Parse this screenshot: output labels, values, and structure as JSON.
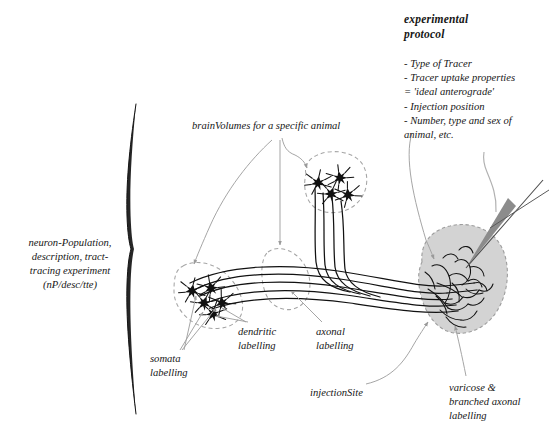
{
  "figure": {
    "background_color": "#ffffff",
    "ink_color": "#161616",
    "annotation_color": "#8d8d8d",
    "blob_fill_color": "#d3d3d3",
    "blob_edge_color": "#9a9a9a",
    "dashed_outline_color": "#a5a5a5",
    "pipette_fill_color": "#8c8c8c"
  },
  "labels": {
    "protocol_title": "experimental\nprotocol",
    "protocol_items": "- Type of Tracer\n- Tracer uptake properties\n   = 'ideal anterograde'\n- Injection position\n- Number, type and sex of\n   animal, etc.",
    "left_brace": "neuron-Population,\ndescription, tract-\ntracing experiment\n(nP/desc/tte)",
    "brain_volumes": "brainVolumes for a specific animal",
    "somata": "somata\nlabelling",
    "dendritic": "dendritic\nlabelling",
    "axonal": "axonal\nlabelling",
    "injection_site": "injectionSite",
    "varicose": "varicose &\nbranched axonal\nlabelling"
  },
  "protocol_items_list": [
    "Type of Tracer",
    "Tracer uptake properties = 'ideal anterograde'",
    "Injection position",
    "Number, type and sex of animal, etc."
  ],
  "structures": {
    "upper_neuron_cluster": {
      "soma_count": 4,
      "region_label": "brainVolume"
    },
    "lower_neuron_cluster": {
      "soma_count": 5,
      "region_label": "brainVolume"
    },
    "middle_dashed_region": {
      "soma_count": 0,
      "region_label": "brainVolume"
    },
    "injection_site_blob": {
      "label": "injectionSite",
      "contains": "varicose & branched axonal labelling"
    },
    "pipette": {
      "label": "injection pipette"
    }
  }
}
